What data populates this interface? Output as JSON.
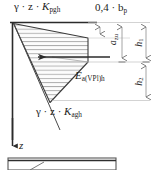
{
  "figure": {
    "type": "earth-pressure-distribution-diagram",
    "title_top_left": "γ · z · K",
    "labels": {
      "passive_pressure": {
        "prefix": "γ · z · ",
        "symbol": "K",
        "subscript": "pgh"
      },
      "active_pressure": {
        "prefix": "γ · z · ",
        "symbol": "K",
        "subscript": "agh"
      },
      "resultant_force": {
        "symbol": "E",
        "subscript": "a(VPl)h"
      },
      "width_dimension": "0,4 · b",
      "width_dimension_sub": "p",
      "depth_dimension": "a",
      "depth_dimension_sub": "zu",
      "upper_height": "h",
      "upper_height_sub": "1",
      "lower_height": "h",
      "lower_height_sub": "2",
      "depth_axis": "z"
    },
    "colors": {
      "line": "#2b2b2b",
      "hatch": "#8a8a8a",
      "dimension": "#9a9a9a",
      "fill": "#fbfbfb",
      "background": "#ffffff"
    },
    "geometry": {
      "wall_x": 12,
      "ground_y": 22,
      "wedge_apex_top": [
        13,
        23
      ],
      "wedge_right_top": [
        88,
        38
      ],
      "wedge_right_mid": [
        88,
        62
      ],
      "wedge_bottom_tip": [
        50,
        103
      ],
      "arrow_tip_x": 38,
      "arrow_tail_x": 110,
      "arrow_y": 57,
      "dimension_ticks_x": [
        100,
        122,
        146
      ],
      "dimension_rows_y": [
        22,
        62,
        100
      ]
    }
  }
}
